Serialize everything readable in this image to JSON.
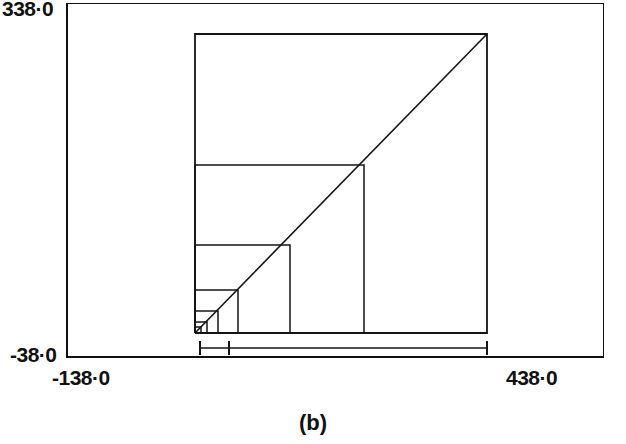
{
  "figure": {
    "caption": "(b)",
    "axes": {
      "y_max_label": "338·0",
      "y_min_label": "-38·0",
      "x_min_label": "-138·0",
      "x_max_label": "438·0",
      "y_max_value": 338.0,
      "y_min_value": -38.0,
      "x_min_value": -138.0,
      "x_max_value": 438.0,
      "frame": {
        "left_px": 66,
        "top_px": 3,
        "right_px": 604,
        "bottom_px": 358
      }
    },
    "ink_color": "#141414",
    "background_color": "#ffffff"
  },
  "chart_data": {
    "type": "line",
    "title": "",
    "subtitle": "",
    "xlabel": "",
    "ylabel": "",
    "xlim": [
      -138.0,
      438.0
    ],
    "ylim": [
      -38.0,
      338.0
    ],
    "grid": false,
    "legend": null,
    "annotations": [
      {
        "text": "(b)",
        "role": "figure-caption",
        "position": "below-axes"
      }
    ],
    "series": [
      {
        "name": "nested-squares",
        "type": "squares",
        "unit": "data-units",
        "common_corner": {
          "x": -4.0,
          "y": -12.0
        },
        "squares": [
          {
            "index": 1,
            "side": 312.0,
            "x0": -4.0,
            "y0": -12.0,
            "x1": 308.0,
            "y1": 300.0
          },
          {
            "index": 2,
            "side": 156.0,
            "x0": -4.0,
            "y0": -12.0,
            "x1": 152.0,
            "y1": 144.0
          },
          {
            "index": 3,
            "side": 78.0,
            "x0": -4.0,
            "y0": -12.0,
            "x1": 74.0,
            "y1": 66.0
          },
          {
            "index": 4,
            "side": 39.0,
            "x0": -4.0,
            "y0": -12.0,
            "x1": 35.0,
            "y1": 27.0
          },
          {
            "index": 5,
            "side": 19.5,
            "x0": -4.0,
            "y0": -12.0,
            "x1": 15.5,
            "y1": 7.5
          },
          {
            "index": 6,
            "side": 9.8,
            "x0": -4.0,
            "y0": -12.0,
            "x1": 5.8,
            "y1": -2.2
          },
          {
            "index": 7,
            "side": 4.9,
            "x0": -4.0,
            "y0": -12.0,
            "x1": 0.9,
            "y1": -7.1
          }
        ]
      },
      {
        "name": "diagonal",
        "type": "line",
        "x": [
          -4.0,
          308.0
        ],
        "y": [
          -12.0,
          300.0
        ]
      },
      {
        "name": "scale-bar",
        "type": "errorbar-horizontal",
        "y": -27.0,
        "x_start": 2.0,
        "x_end": 308.0,
        "tick_positions": [
          2.0,
          33.0,
          308.0
        ]
      }
    ]
  },
  "geometry_px": {
    "squares": [
      {
        "x0": 195,
        "y0": 333,
        "x1": 487,
        "y1": 34
      },
      {
        "x0": 195,
        "y0": 333,
        "x1": 364,
        "y1": 165
      },
      {
        "x0": 195,
        "y0": 333,
        "x1": 290,
        "y1": 245
      },
      {
        "x0": 195,
        "y0": 333,
        "x1": 238,
        "y1": 290
      },
      {
        "x0": 195,
        "y0": 333,
        "x1": 218,
        "y1": 311
      },
      {
        "x0": 195,
        "y0": 333,
        "x1": 207,
        "y1": 322
      },
      {
        "x0": 195,
        "y0": 333,
        "x1": 201,
        "y1": 327
      }
    ],
    "diagonal": {
      "x0": 195,
      "y0": 333,
      "x1": 487,
      "y1": 34
    },
    "scale_bar": {
      "y": 348,
      "x_start": 200,
      "x_end": 487,
      "ticks": [
        200,
        229,
        487
      ],
      "tick_half_height": 7
    }
  }
}
